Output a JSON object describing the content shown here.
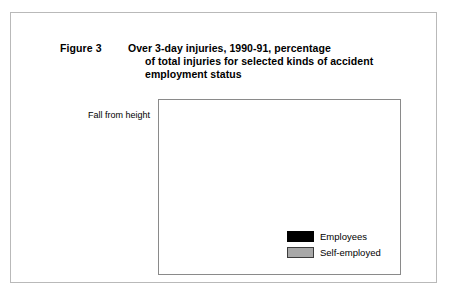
{
  "figure": {
    "number_label": "Figure 3",
    "title_lines": [
      "Over 3-day injuries, 1990-91, percentage",
      "of total injuries for selected kinds of accident",
      "employment status"
    ]
  },
  "colors": {
    "employees": "#000000",
    "self_employed": "#a8a8a8",
    "plot_border": "#8a8a8a",
    "figure_border": "#b9b9b9",
    "background": "#ffffff"
  },
  "legend": {
    "position": "inside-bottom-right",
    "items": [
      {
        "label": "Employees",
        "swatch": "employees-swatch"
      },
      {
        "label": "Self-employed",
        "swatch": "self-employed-swatch"
      }
    ]
  },
  "chart_data": {
    "type": "bar",
    "orientation": "horizontal",
    "title": "Over 3-day injuries, 1990-91, percentage of total injuries for selected kinds of accident employment status",
    "subtitle": "",
    "xlabel": "",
    "ylabel": "",
    "xlim": [
      0,
      35
    ],
    "grid": false,
    "legend_position": "inside-bottom-right",
    "categories": [
      "Fall from height",
      "Struck by object",
      "Slip",
      "Handling",
      "Walk into"
    ],
    "series": [
      {
        "name": "Employees",
        "values": [
          7.8,
          14.5,
          20.8,
          33.7,
          6.4
        ]
      },
      {
        "name": "Self-employed",
        "values": [
          28.2,
          21.9,
          13.5,
          13.0,
          5.1
        ]
      }
    ],
    "value_labels": [
      [
        "7.8",
        "28.2"
      ],
      [
        "14.5",
        "21.9"
      ],
      [
        "20.8",
        "13.5"
      ],
      [
        "33.7",
        "13.0"
      ],
      [
        "6.4",
        "5.1"
      ]
    ]
  }
}
